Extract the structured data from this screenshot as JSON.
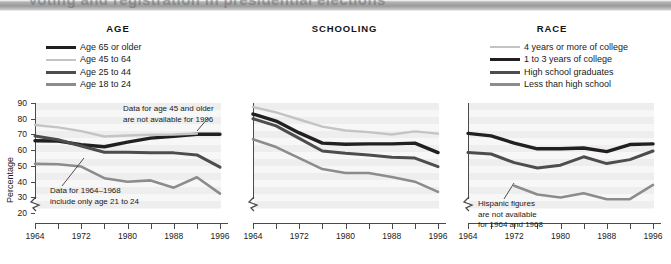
{
  "figure": {
    "clipped_title": "Voting and registration in presidential elections",
    "background": "#ffffff"
  },
  "colors": {
    "very_dark": "#231f20",
    "dark": "#4d4d4d",
    "mid_gray": "#8c8c8c",
    "light_gray": "#c4c4c4",
    "axis": "#4a4a4a",
    "plot_bg": "#f2f2f2",
    "band": "#eeeeee"
  },
  "panels": [
    {
      "id": "age",
      "title": "AGE",
      "legend": [
        {
          "label": "Age 65 or older",
          "color": "#231f20",
          "width": 3.4
        },
        {
          "label": "Age 45 to 64",
          "color": "#c4c4c4",
          "width": 2.4
        },
        {
          "label": "Age 25 to 44",
          "color": "#4d4d4d",
          "width": 3.0
        },
        {
          "label": "Age 18 to 24",
          "color": "#8c8c8c",
          "width": 2.6
        }
      ],
      "annotations": [
        {
          "id": "age-45-note",
          "text_lines": [
            "Data for age 45 and older",
            "are not available for 1996"
          ]
        },
        {
          "id": "age-2124-note",
          "text_lines": [
            "Data for 1964–1968",
            "include only age 21 to 24"
          ]
        }
      ]
    },
    {
      "id": "schooling",
      "title": "SCHOOLING",
      "legend": [
        {
          "label": "4 years or more of college",
          "color": "#c4c4c4",
          "width": 2.4
        },
        {
          "label": "1 to 3 years of college",
          "color": "#231f20",
          "width": 3.4
        },
        {
          "label": "High school graduates",
          "color": "#4d4d4d",
          "width": 3.0
        },
        {
          "label": "Less than high school",
          "color": "#8c8c8c",
          "width": 2.6
        }
      ],
      "annotations": []
    },
    {
      "id": "race",
      "title": "RACE",
      "legend": [
        {
          "label": "White",
          "color": "#231f20",
          "width": 3.4
        },
        {
          "label": "Black",
          "color": "#4d4d4d",
          "width": 3.0
        },
        {
          "label": "Hispanic",
          "color": "#8c8c8c",
          "width": 2.6
        }
      ],
      "annotations": [
        {
          "id": "hispanic-note",
          "text_lines": [
            "Hispanic figures",
            "are not available",
            "for 1964 and 1968"
          ]
        }
      ]
    }
  ],
  "chart_data": [
    {
      "type": "line",
      "id": "age",
      "title": "AGE",
      "xlabel": "",
      "ylabel": "Percentage",
      "x": [
        1964,
        1968,
        1972,
        1976,
        1980,
        1984,
        1988,
        1992,
        1996
      ],
      "xticks": [
        1964,
        1968,
        1972,
        1976,
        1980,
        1984,
        1988,
        1992,
        1996
      ],
      "xticklabels": [
        "1964",
        "",
        "1972",
        "",
        "1980",
        "",
        "1988",
        "",
        "1996"
      ],
      "yticks": [
        20,
        30,
        40,
        50,
        60,
        70,
        80,
        90
      ],
      "ylim": [
        15,
        90
      ],
      "xlim": [
        1964,
        1996
      ],
      "axis_break_y": true,
      "grid": "horizontal-bands",
      "legend_position": "above",
      "series": [
        {
          "name": "Age 65 or older",
          "color": "#231f20",
          "values": [
            66.0,
            65.8,
            63.5,
            62.2,
            65.1,
            67.7,
            68.8,
            70.1,
            70.1
          ]
        },
        {
          "name": "Age 45 to 64",
          "color": "#c4c4c4",
          "values": [
            76.0,
            74.5,
            72.1,
            68.7,
            69.3,
            69.8,
            70.0,
            70.6,
            null
          ]
        },
        {
          "name": "Age 25 to 44",
          "color": "#4d4d4d",
          "values": [
            69.0,
            66.6,
            62.7,
            58.7,
            58.7,
            58.4,
            58.3,
            57.0,
            49.2
          ]
        },
        {
          "name": "Age 18 to 24",
          "color": "#8c8c8c",
          "values": [
            51.3,
            51.1,
            49.6,
            42.2,
            39.9,
            40.8,
            36.2,
            42.8,
            32.4
          ]
        }
      ],
      "annotations": [
        {
          "text": "Data for age 45 and older are not available for 1996",
          "points_to": "Age 45 to 64 series end (1992)"
        },
        {
          "text": "Data for 1964–1968 include only age 21 to 24",
          "points_to": "Age 18 to 24 series start (1964)"
        }
      ]
    },
    {
      "type": "line",
      "id": "schooling",
      "title": "SCHOOLING",
      "xlabel": "",
      "ylabel": "",
      "x": [
        1964,
        1968,
        1972,
        1976,
        1980,
        1984,
        1988,
        1992,
        1996
      ],
      "xticks": [
        1964,
        1968,
        1972,
        1976,
        1980,
        1984,
        1988,
        1992,
        1996
      ],
      "xticklabels": [
        "1964",
        "",
        "1972",
        "",
        "1980",
        "",
        "1988",
        "",
        "1996"
      ],
      "yticks": [
        20,
        30,
        40,
        50,
        60,
        70,
        80,
        90
      ],
      "ylim": [
        15,
        90
      ],
      "xlim": [
        1964,
        1996
      ],
      "axis_break_y": true,
      "grid": "horizontal-bands",
      "legend_position": "above",
      "series": [
        {
          "name": "4 years or more of college",
          "color": "#c4c4c4",
          "values": [
            87.5,
            84.0,
            79.5,
            75.0,
            72.5,
            71.5,
            70.0,
            72.0,
            70.5
          ]
        },
        {
          "name": "1 to 3 years of college",
          "color": "#231f20",
          "values": [
            83.0,
            78.5,
            71.0,
            64.5,
            63.8,
            64.0,
            64.0,
            64.5,
            58.5
          ]
        },
        {
          "name": "High school graduates",
          "color": "#4d4d4d",
          "values": [
            80.0,
            75.5,
            67.5,
            59.5,
            58.0,
            57.0,
            55.5,
            55.0,
            49.5
          ]
        },
        {
          "name": "Less than high school",
          "color": "#8c8c8c",
          "values": [
            67.0,
            62.0,
            55.0,
            48.0,
            45.5,
            45.5,
            43.0,
            40.0,
            33.5
          ]
        }
      ],
      "annotations": []
    },
    {
      "type": "line",
      "id": "race",
      "title": "RACE",
      "xlabel": "",
      "ylabel": "",
      "x": [
        1964,
        1968,
        1972,
        1976,
        1980,
        1984,
        1988,
        1992,
        1996
      ],
      "xticks": [
        1964,
        1968,
        1972,
        1976,
        1980,
        1984,
        1988,
        1992,
        1996
      ],
      "xticklabels": [
        "1964",
        "",
        "1972",
        "",
        "1980",
        "",
        "1988",
        "",
        "1996"
      ],
      "yticks": [
        20,
        30,
        40,
        50,
        60,
        70,
        80,
        90
      ],
      "ylim": [
        15,
        90
      ],
      "xlim": [
        1964,
        1996
      ],
      "axis_break_y": true,
      "grid": "horizontal-bands",
      "legend_position": "above",
      "series": [
        {
          "name": "White",
          "color": "#231f20",
          "values": [
            70.7,
            69.1,
            64.5,
            60.9,
            60.9,
            61.4,
            59.1,
            63.6,
            64.0
          ]
        },
        {
          "name": "Black",
          "color": "#4d4d4d",
          "values": [
            58.5,
            57.6,
            52.1,
            48.7,
            50.5,
            55.8,
            51.5,
            54.0,
            59.5
          ]
        },
        {
          "name": "Hispanic",
          "color": "#8c8c8c",
          "values": [
            null,
            null,
            37.4,
            31.8,
            29.9,
            32.6,
            28.8,
            28.9,
            38.0
          ]
        }
      ],
      "annotations": [
        {
          "text": "Hispanic figures are not available for 1964 and 1968",
          "points_to": "Hispanic series start (1972)"
        }
      ]
    }
  ]
}
